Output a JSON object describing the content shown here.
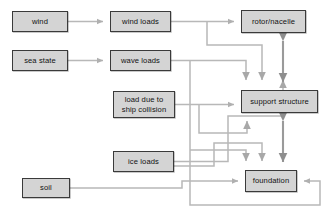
{
  "diagram": {
    "type": "flow-diagram",
    "title": "",
    "style": {
      "node_fill": "#d4d4d4",
      "node_border": "#3a3a3a",
      "edge_color": "#b3b3b3",
      "background": "#ffffff",
      "text_color": "#111111"
    },
    "nodes": [
      {
        "id": "wind",
        "label": "wind",
        "x": 12,
        "y": 11,
        "w": 56,
        "h": 21
      },
      {
        "id": "wind-loads",
        "label": "wind loads",
        "x": 110,
        "y": 11,
        "w": 61,
        "h": 21
      },
      {
        "id": "rotor-nacelle",
        "label": "rotor/nacelle",
        "x": 241,
        "y": 10,
        "w": 65,
        "h": 23
      },
      {
        "id": "sea-state",
        "label": "sea state",
        "x": 12,
        "y": 50,
        "w": 56,
        "h": 21
      },
      {
        "id": "wave-loads",
        "label": "wave loads",
        "x": 110,
        "y": 50,
        "w": 61,
        "h": 21
      },
      {
        "id": "ship-collision",
        "label": "load due to\nship collision",
        "x": 113,
        "y": 91,
        "w": 62,
        "h": 27
      },
      {
        "id": "support-structure",
        "label": "support structure",
        "x": 241,
        "y": 90,
        "w": 77,
        "h": 23
      },
      {
        "id": "ice-loads",
        "label": "ice loads",
        "x": 113,
        "y": 151,
        "w": 61,
        "h": 21
      },
      {
        "id": "soil",
        "label": "soil",
        "x": 22,
        "y": 178,
        "w": 48,
        "h": 20
      },
      {
        "id": "foundation",
        "label": "foundation",
        "x": 245,
        "y": 170,
        "w": 52,
        "h": 22
      }
    ],
    "edges": [
      {
        "id": "wind-to-wind-loads",
        "from": "wind",
        "to": "wind-loads",
        "direction": "one-way"
      },
      {
        "id": "sea-state-to-wave-loads",
        "from": "sea state",
        "to": "wave loads",
        "direction": "one-way"
      },
      {
        "id": "wind-loads-to-rotor-nacelle",
        "from": "wind loads",
        "to": "rotor/nacelle",
        "direction": "one-way"
      },
      {
        "id": "wind-loads-to-support-structure",
        "from": "wind loads",
        "to": "support structure",
        "direction": "one-way"
      },
      {
        "id": "wave-loads-to-support-structure",
        "from": "wave loads",
        "to": "support structure",
        "direction": "one-way"
      },
      {
        "id": "wave-loads-to-foundation",
        "from": "wave loads",
        "to": "foundation",
        "direction": "one-way"
      },
      {
        "id": "ship-collision-to-support",
        "from": "load due to ship collision",
        "to": "support structure",
        "direction": "one-way"
      },
      {
        "id": "ship-collision-to-foundation",
        "from": "load due to ship collision",
        "to": "foundation",
        "direction": "one-way"
      },
      {
        "id": "ice-loads-to-support-structure",
        "from": "ice loads",
        "to": "support structure",
        "direction": "one-way"
      },
      {
        "id": "ice-loads-to-foundation",
        "from": "ice loads",
        "to": "foundation",
        "direction": "one-way"
      },
      {
        "id": "soil-to-foundation",
        "from": "soil",
        "to": "foundation",
        "direction": "one-way"
      },
      {
        "id": "rotor-nacelle-support-structure",
        "from": "rotor/nacelle",
        "to": "support structure",
        "direction": "two-way"
      },
      {
        "id": "support-structure-foundation",
        "from": "support structure",
        "to": "foundation",
        "direction": "two-way"
      }
    ]
  }
}
